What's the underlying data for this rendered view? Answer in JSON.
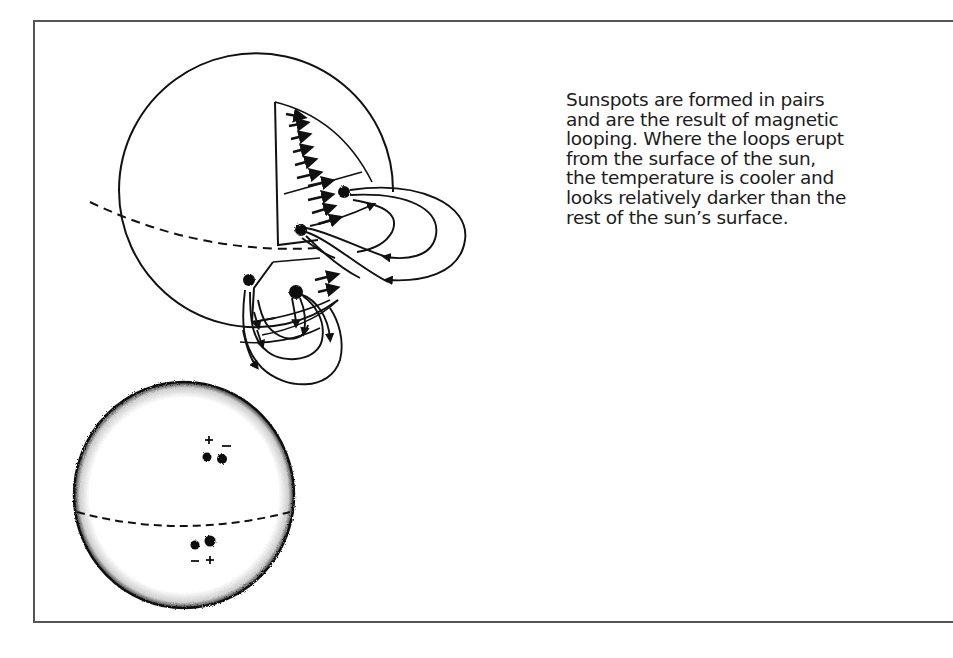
{
  "caption": {
    "lines": [
      "Sunspots are formed in pairs",
      "and are the result of magnetic",
      "looping. Where the loops erupt",
      "from the surface of the sun,",
      "the temperature is cooler and",
      "looks relatively darker than the",
      "rest of the sun’s surface."
    ]
  },
  "figures": {
    "cutaway_sphere": {
      "description": "Cutaway sun showing internal rotation arrows and magnetic loops erupting between sunspot pairs",
      "sunspot_pairs": 2
    },
    "surface_sphere": {
      "description": "Sun disk with equator and two sunspot pairs of opposite polarity",
      "northern_pair_labels": [
        "+",
        "−"
      ],
      "southern_pair_labels": [
        "−",
        "+"
      ]
    }
  },
  "colors": {
    "ink": "#111111",
    "frame": "#555555",
    "background": "#ffffff"
  }
}
